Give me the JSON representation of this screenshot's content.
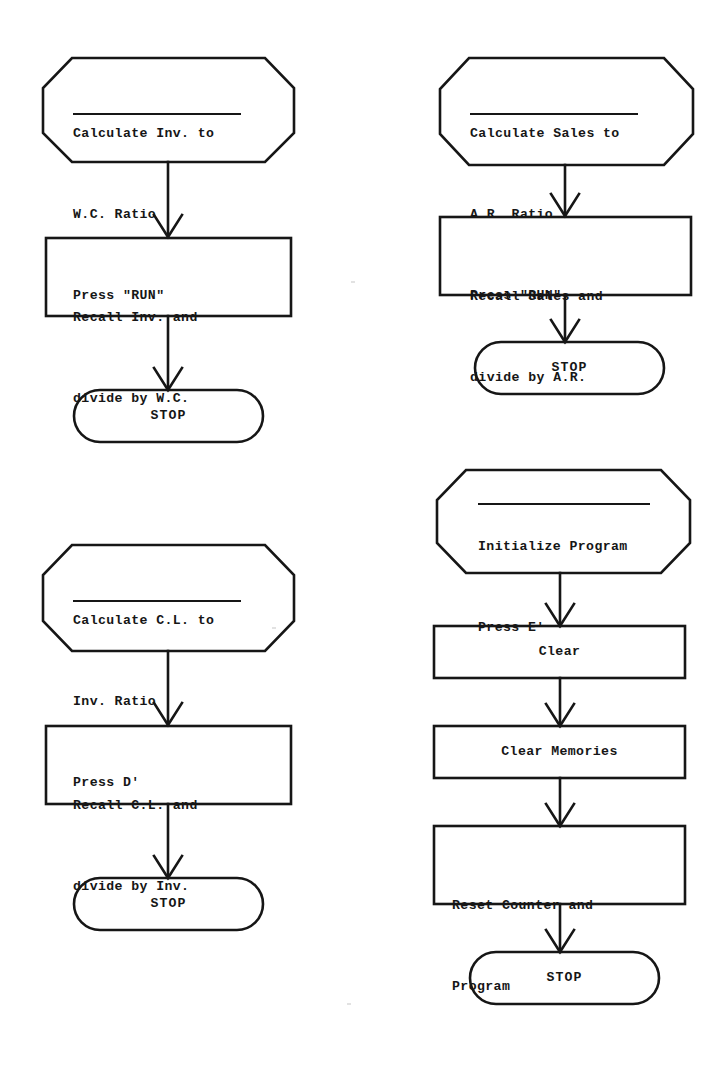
{
  "document": {
    "type": "flowchart-sheet",
    "description": "Four calculator program flowcharts",
    "ink_color": "#161616",
    "paper_color": "#ffffff"
  },
  "flowcharts": [
    {
      "id": "inv-to-wc",
      "position": "top-left",
      "nodes": [
        {
          "shape": "octagon",
          "name": "start-terminator",
          "lines": [
            "Calculate Inv. to",
            "W.C. Ratio",
            "Press \"RUN\""
          ],
          "underline_after_line": 2
        },
        {
          "shape": "rectangle",
          "name": "process-step",
          "lines": [
            "Recall Inv. and",
            "divide by W.C."
          ]
        },
        {
          "shape": "pill",
          "name": "stop-terminator",
          "lines": [
            "STOP"
          ]
        }
      ],
      "connectors": 2
    },
    {
      "id": "sales-to-ar",
      "position": "top-right",
      "nodes": [
        {
          "shape": "octagon",
          "name": "start-terminator",
          "lines": [
            "Calculate Sales to",
            "A.R. Ratio",
            "Press \"RUN\""
          ],
          "underline_after_line": 2
        },
        {
          "shape": "rectangle",
          "name": "process-step",
          "lines": [
            "Recall Sales and",
            "divide by A.R."
          ]
        },
        {
          "shape": "pill",
          "name": "stop-terminator",
          "lines": [
            "STOP"
          ]
        }
      ],
      "connectors": 2
    },
    {
      "id": "cl-to-inv",
      "position": "bottom-left",
      "nodes": [
        {
          "shape": "octagon",
          "name": "start-terminator",
          "lines": [
            "Calculate C.L. to",
            "Inv. Ratio",
            "Press D'"
          ],
          "underline_after_line": 2
        },
        {
          "shape": "rectangle",
          "name": "process-step",
          "lines": [
            "Recall C.L. and",
            "divide by Inv."
          ]
        },
        {
          "shape": "pill",
          "name": "stop-terminator",
          "lines": [
            "STOP"
          ]
        }
      ],
      "connectors": 2
    },
    {
      "id": "initialize-program",
      "position": "bottom-right",
      "nodes": [
        {
          "shape": "octagon",
          "name": "start-terminator",
          "lines": [
            "Initialize Program",
            "Press E'"
          ],
          "underline_after_line": 1
        },
        {
          "shape": "rectangle",
          "name": "process-step",
          "lines": [
            "Clear"
          ]
        },
        {
          "shape": "rectangle",
          "name": "process-step",
          "lines": [
            "Clear Memories"
          ]
        },
        {
          "shape": "rectangle",
          "name": "process-step",
          "lines": [
            "Reset Counter and",
            "Program"
          ]
        },
        {
          "shape": "pill",
          "name": "stop-terminator",
          "lines": [
            "STOP"
          ]
        }
      ],
      "connectors": 4
    }
  ],
  "chart1": {
    "start_l1": "Calculate Inv. to",
    "start_l2": "W.C. Ratio",
    "start_l3": "Press \"RUN\"",
    "proc_l1": "Recall Inv. and",
    "proc_l2": "divide by W.C.",
    "stop": "STOP"
  },
  "chart2": {
    "start_l1": "Calculate Sales to",
    "start_l2": "A.R. Ratio",
    "start_l3": "Press \"RUN\"",
    "proc_l1": "Recall Sales and",
    "proc_l2": "divide by A.R.",
    "stop": "STOP"
  },
  "chart3": {
    "start_l1": "Calculate C.L. to",
    "start_l2": "Inv. Ratio",
    "start_l3": "Press D'",
    "proc_l1": "Recall C.L. and",
    "proc_l2": "divide by Inv.",
    "stop": "STOP"
  },
  "chart4": {
    "start_l1": "Initialize Program",
    "start_l2": "Press E'",
    "step1": "Clear",
    "step2": "Clear Memories",
    "step3_l1": "Reset Counter and",
    "step3_l2": "Program",
    "stop": "STOP"
  }
}
